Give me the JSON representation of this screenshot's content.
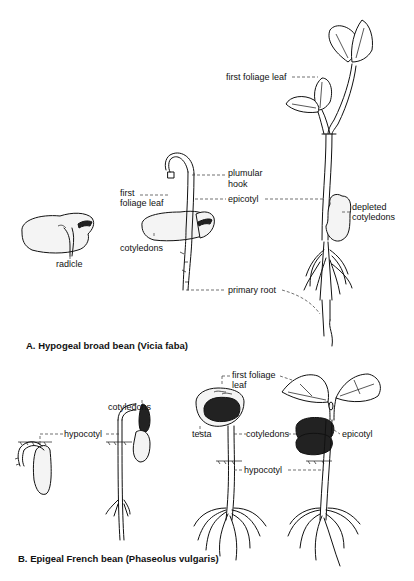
{
  "figure": {
    "panel_a": {
      "caption": "A. Hypogeal  broad bean  (Vicia faba)",
      "labels": {
        "radicle": "radicle",
        "first_foliage_leaf_small": "first\nfoliage leaf",
        "first_foliage_leaf_small_line1": "first",
        "first_foliage_leaf_small_line2": "foliage leaf",
        "cotyledons": "cotyledons",
        "plumular_hook_line1": "plumular",
        "plumular_hook_line2": "hook",
        "epicotyl": "epicotyl",
        "primary_root": "primary root",
        "first_foliage_leaf_large": "first foliage leaf",
        "depleted_cotyledons_line1": "depleted",
        "depleted_cotyledons_line2": "cotyledons"
      }
    },
    "panel_b": {
      "caption": "B. Epigeal French bean  (Phaseolus vulgaris)",
      "labels": {
        "hypocotyl_1": "hypocotyl",
        "cotyledons_1": "cotyledons",
        "first_foliage_leaf_line1": "first foliage",
        "first_foliage_leaf_line2": "leaf",
        "testa": "testa",
        "cotyledons_2": "cotyledons",
        "epicotyl": "epicotyl",
        "hypocotyl_2": "hypocotyl"
      }
    }
  }
}
